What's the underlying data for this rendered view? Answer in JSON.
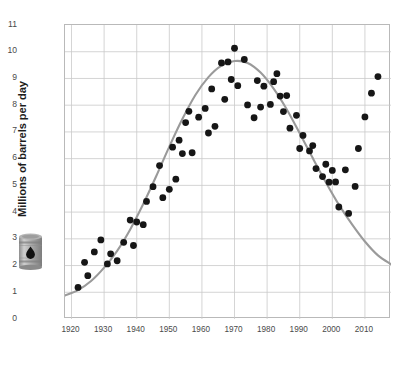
{
  "figure": {
    "ylabel": "Millions of barrels per day",
    "icon": "oil-barrel-icon",
    "accent_curve_color": "#9a9a9a",
    "point_color": "#161616",
    "grid_color": "#c9c9c9",
    "axis_color": "#b9b9b9",
    "tick_text_color": "#4a4a4a"
  },
  "chart_data": {
    "type": "scatter",
    "title": "",
    "subtitle": "",
    "xlabel": "",
    "ylabel": "Millions of barrels per day",
    "xlim": [
      1918,
      2018
    ],
    "ylim": [
      0,
      11
    ],
    "grid": true,
    "legend": null,
    "xticks": [
      1920,
      1930,
      1940,
      1950,
      1960,
      1970,
      1980,
      1990,
      2000,
      2010
    ],
    "xtick_labels": [
      "1920",
      "1930",
      "1940",
      "1950",
      "1960",
      "1970",
      "1980",
      "1990",
      "2000",
      "2010"
    ],
    "yticks": [
      0,
      1,
      2,
      3,
      4,
      5,
      6,
      7,
      8,
      9,
      10,
      11
    ],
    "ytick_labels": [
      "0",
      "1",
      "2",
      "3",
      "4",
      "5",
      "6",
      "7",
      "8",
      "9",
      "10",
      "11"
    ],
    "series": [
      {
        "name": "Annual production",
        "type": "scatter",
        "marker": "circle",
        "color": "#161616",
        "points": [
          [
            1922,
            1.18
          ],
          [
            1924,
            2.12
          ],
          [
            1925,
            1.62
          ],
          [
            1927,
            2.51
          ],
          [
            1929,
            2.96
          ],
          [
            1931,
            2.06
          ],
          [
            1932,
            2.44
          ],
          [
            1934,
            2.18
          ],
          [
            1936,
            2.87
          ],
          [
            1938,
            3.7
          ],
          [
            1939,
            2.75
          ],
          [
            1940,
            3.63
          ],
          [
            1942,
            3.53
          ],
          [
            1943,
            4.4
          ],
          [
            1945,
            4.95
          ],
          [
            1947,
            5.74
          ],
          [
            1948,
            4.54
          ],
          [
            1950,
            4.85
          ],
          [
            1951,
            6.43
          ],
          [
            1952,
            5.23
          ],
          [
            1953,
            6.69
          ],
          [
            1954,
            6.19
          ],
          [
            1955,
            7.35
          ],
          [
            1956,
            7.77
          ],
          [
            1957,
            6.22
          ],
          [
            1959,
            7.55
          ],
          [
            1961,
            7.88
          ],
          [
            1962,
            6.96
          ],
          [
            1963,
            8.61
          ],
          [
            1964,
            7.21
          ],
          [
            1966,
            9.58
          ],
          [
            1967,
            8.22
          ],
          [
            1968,
            9.62
          ],
          [
            1969,
            8.96
          ],
          [
            1970,
            10.13
          ],
          [
            1971,
            8.73
          ],
          [
            1973,
            9.71
          ],
          [
            1974,
            8.01
          ],
          [
            1976,
            7.53
          ],
          [
            1977,
            8.92
          ],
          [
            1978,
            7.93
          ],
          [
            1979,
            8.71
          ],
          [
            1981,
            8.03
          ],
          [
            1982,
            8.88
          ],
          [
            1983,
            9.18
          ],
          [
            1984,
            8.34
          ],
          [
            1985,
            7.76
          ],
          [
            1986,
            8.36
          ],
          [
            1987,
            7.14
          ],
          [
            1989,
            7.62
          ],
          [
            1990,
            6.38
          ],
          [
            1991,
            6.87
          ],
          [
            1993,
            6.29
          ],
          [
            1994,
            6.49
          ],
          [
            1995,
            5.63
          ],
          [
            1997,
            5.33
          ],
          [
            1998,
            5.79
          ],
          [
            1999,
            5.12
          ],
          [
            2000,
            5.56
          ],
          [
            2001,
            5.13
          ],
          [
            2002,
            4.19
          ],
          [
            2004,
            5.58
          ],
          [
            2005,
            3.95
          ],
          [
            2007,
            4.96
          ],
          [
            2008,
            6.38
          ],
          [
            2010,
            7.56
          ],
          [
            2012,
            8.45
          ],
          [
            2014,
            9.07
          ]
        ]
      },
      {
        "name": "Hubbert fitted curve",
        "type": "line",
        "color": "#9a9a9a",
        "points": [
          [
            1918,
            0.88
          ],
          [
            1922,
            1.08
          ],
          [
            1926,
            1.42
          ],
          [
            1930,
            1.92
          ],
          [
            1934,
            2.55
          ],
          [
            1938,
            3.35
          ],
          [
            1942,
            4.3
          ],
          [
            1946,
            5.35
          ],
          [
            1950,
            6.45
          ],
          [
            1954,
            7.48
          ],
          [
            1958,
            8.38
          ],
          [
            1962,
            9.05
          ],
          [
            1966,
            9.48
          ],
          [
            1970,
            9.65
          ],
          [
            1974,
            9.58
          ],
          [
            1978,
            9.22
          ],
          [
            1982,
            8.62
          ],
          [
            1986,
            7.85
          ],
          [
            1990,
            6.95
          ],
          [
            1994,
            6.02
          ],
          [
            1998,
            5.12
          ],
          [
            2002,
            4.28
          ],
          [
            2006,
            3.55
          ],
          [
            2010,
            2.9
          ],
          [
            2014,
            2.38
          ],
          [
            2018,
            2.05
          ]
        ]
      }
    ]
  }
}
